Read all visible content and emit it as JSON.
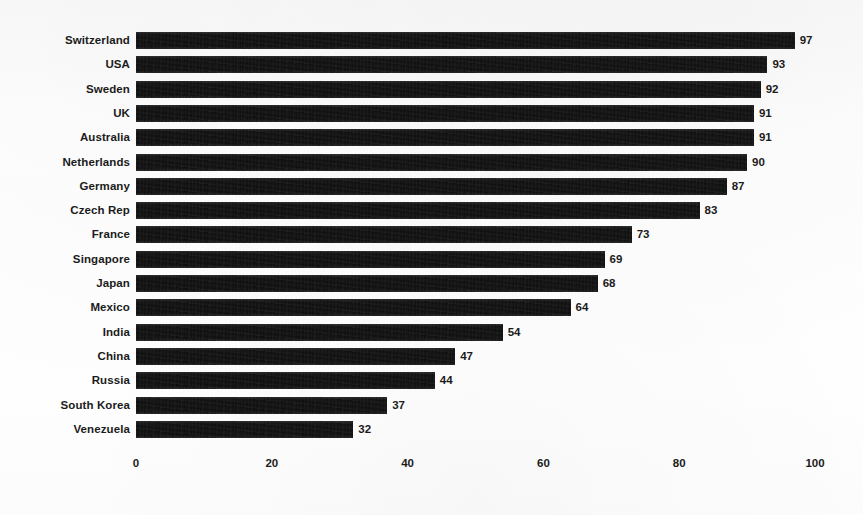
{
  "chart_data": {
    "type": "bar",
    "orientation": "horizontal",
    "title": "",
    "subtitle": "",
    "xlabel": "",
    "ylabel": "",
    "xlim": [
      0,
      100
    ],
    "xticks": [
      0,
      20,
      40,
      60,
      80,
      100
    ],
    "xtick_labels": [
      "0",
      "20",
      "40",
      "60",
      "80",
      "100"
    ],
    "grid": false,
    "legend": false,
    "legend_position": "none",
    "bar_color": "#0d0d0d",
    "value_labels_shown": true,
    "sorted": "descending",
    "categories": [
      "Switzerland",
      "USA",
      "Sweden",
      "UK",
      "Australia",
      "Netherlands",
      "Germany",
      "Czech Rep",
      "France",
      "Singapore",
      "Japan",
      "Mexico",
      "India",
      "China",
      "Russia",
      "South Korea",
      "Venezuela"
    ],
    "values": [
      97,
      93,
      92,
      91,
      91,
      90,
      87,
      83,
      73,
      69,
      68,
      64,
      54,
      47,
      44,
      37,
      32
    ],
    "value_label_texts": [
      "97",
      "93",
      "92",
      "91",
      "91",
      "90",
      "87",
      "83",
      "73",
      "69",
      "68",
      "64",
      "54",
      "47",
      "44",
      "37",
      "32"
    ]
  },
  "colors": {
    "bar": "#0d0d0d",
    "text": "#1b1b1b",
    "background": "#ffffff"
  }
}
